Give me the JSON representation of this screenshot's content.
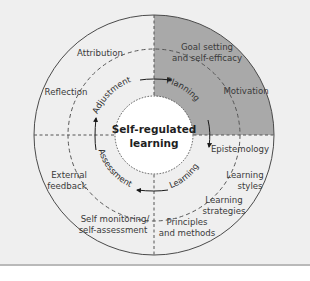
{
  "diagram": {
    "title": "Self-regulated learning",
    "center": {
      "line1": "Self-regulated",
      "line2": "learning"
    },
    "colors": {
      "background": "#efefef",
      "shaded_quadrant": "#a9a9a9",
      "line": "#4a4a4a",
      "center_fill": "#ffffff"
    },
    "cycle": [
      {
        "label": "Planning",
        "position": "top-right"
      },
      {
        "label": "Learning",
        "position": "bottom-right"
      },
      {
        "label": "Assessment",
        "position": "bottom-left"
      },
      {
        "label": "Adjustment",
        "position": "top-left"
      }
    ],
    "outer_factors": {
      "top_left": [
        "Attribution",
        "Reflection"
      ],
      "top_right": [
        {
          "line1": "Goal setting",
          "line2": "and self-efficacy"
        },
        {
          "line1": "Motivation"
        }
      ],
      "bottom_right": [
        {
          "line1": "Epistemology"
        },
        {
          "line1": "Learning",
          "line2": "styles"
        },
        {
          "line1": "Learning",
          "line2": "strategies"
        },
        {
          "line1": "Principles",
          "line2": "and methods"
        }
      ],
      "bottom_left": [
        {
          "line1": "External",
          "line2": "feedback"
        },
        {
          "line1": "Self monitoring/",
          "line2": "self-assessment"
        }
      ]
    }
  }
}
